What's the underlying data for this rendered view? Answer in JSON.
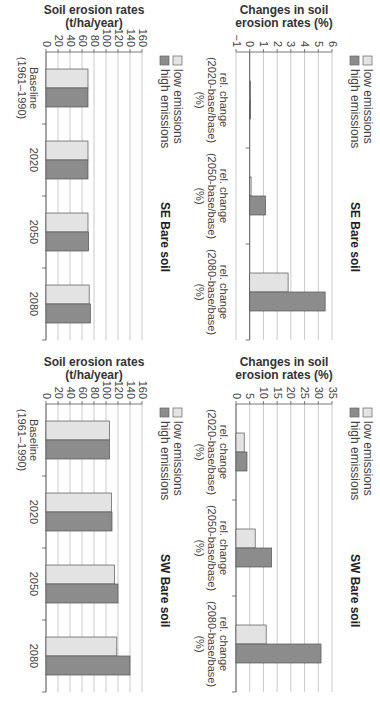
{
  "legend": {
    "low_label": "low emissions",
    "high_label": "high emissions",
    "low_color": "#e3e3e3",
    "high_color": "#8c8c8c"
  },
  "chart_data": [
    {
      "type": "bar",
      "title": "SE Bare soil",
      "ylabel": "Soil erosion rates (t/ha/year)",
      "ylabel_line1": "Soil erosion rates",
      "ylabel_line2": "(t/ha/year)",
      "xlabel": "",
      "ylim": [
        0,
        160
      ],
      "yticks": [
        0,
        20,
        40,
        60,
        80,
        100,
        120,
        140,
        160
      ],
      "grid": true,
      "legend_position": "top-left",
      "categories": [
        "Baseline (1961–1990)",
        "2020",
        "2050",
        "2080"
      ],
      "category_lines": [
        [
          "Baseline",
          "(1961–1990)"
        ],
        [
          "2020"
        ],
        [
          "2050"
        ],
        [
          "2080"
        ]
      ],
      "series": [
        {
          "name": "low emissions",
          "values": [
            70,
            70,
            70,
            72
          ]
        },
        {
          "name": "high emissions",
          "values": [
            70,
            70,
            71,
            74
          ]
        }
      ]
    },
    {
      "type": "bar",
      "title": "SE Bare soil",
      "ylabel": "Changes in soil erosion rates (%)",
      "ylabel_line1": "Changes in soil",
      "ylabel_line2": "erosion rates (%)",
      "xlabel": "",
      "ylim": [
        -1,
        6
      ],
      "yticks": [
        -1,
        0,
        1,
        2,
        3,
        4,
        5,
        6
      ],
      "grid": true,
      "legend_position": "top-left",
      "categories": [
        "rel. change (2020-base/base) (%)",
        "rel. change (2050-base/base) (%)",
        "rel. change (2080-base/base) (%)"
      ],
      "category_lines": [
        [
          "rel. change",
          "(2020-base/base)",
          "(%)"
        ],
        [
          "rel. change",
          "(2050-base/base)",
          "(%)"
        ],
        [
          "rel. change",
          "(2080-base/base)",
          "(%)"
        ]
      ],
      "series": [
        {
          "name": "low emissions",
          "values": [
            0.05,
            0.1,
            2.8
          ]
        },
        {
          "name": "high emissions",
          "values": [
            0.05,
            1.15,
            5.5
          ]
        }
      ]
    },
    {
      "type": "bar",
      "title": "SW Bare soil",
      "ylabel": "Soil erosion rates (t/ha/year)",
      "ylabel_line1": "Soil erosion rates",
      "ylabel_line2": "(t/ha/year)",
      "xlabel": "",
      "ylim": [
        0,
        160
      ],
      "yticks": [
        0,
        20,
        40,
        60,
        80,
        100,
        120,
        140,
        160
      ],
      "grid": true,
      "legend_position": "top-left",
      "categories": [
        "Baseline (1961–1990)",
        "2020",
        "2050",
        "2080"
      ],
      "category_lines": [
        [
          "Baseline",
          "(1961–1990)"
        ],
        [
          "2020"
        ],
        [
          "2050"
        ],
        [
          "2080"
        ]
      ],
      "series": [
        {
          "name": "low emissions",
          "values": [
            106,
            109,
            114,
            118
          ]
        },
        {
          "name": "high emissions",
          "values": [
            106,
            110,
            120,
            140
          ]
        }
      ]
    },
    {
      "type": "bar",
      "title": "SW Bare soil",
      "ylabel": "Changes in soil erosion rates (%)",
      "ylabel_line1": "Changes in soil",
      "ylabel_line2": "erosion rates (%)",
      "xlabel": "",
      "ylim": [
        0,
        35
      ],
      "yticks": [
        0,
        5,
        10,
        15,
        20,
        25,
        30,
        35
      ],
      "grid": true,
      "legend_position": "top-left",
      "categories": [
        "rel. change (2020-base/base) (%)",
        "rel. change (2050-base/base) (%)",
        "rel. change (2080-base/base) (%)"
      ],
      "category_lines": [
        [
          "rel. change",
          "(2020-base/base)",
          "(%)"
        ],
        [
          "rel. change",
          "(2050-base/base)",
          "(%)"
        ],
        [
          "rel. change",
          "(2080-base/base)",
          "(%)"
        ]
      ],
      "series": [
        {
          "name": "low emissions",
          "values": [
            3,
            7,
            11
          ]
        },
        {
          "name": "high emissions",
          "values": [
            4,
            13,
            31
          ]
        }
      ]
    }
  ]
}
